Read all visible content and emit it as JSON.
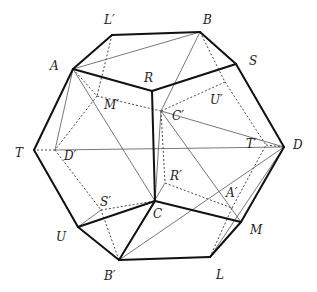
{
  "diagram": {
    "title": "",
    "vertices": {
      "A": [
        73,
        69
      ],
      "Lp": [
        112,
        35
      ],
      "B": [
        200,
        32
      ],
      "S": [
        236,
        64
      ],
      "R": [
        152,
        91
      ],
      "T": [
        34,
        150
      ],
      "D": [
        284,
        147
      ],
      "C": [
        155,
        201
      ],
      "U": [
        78,
        227
      ],
      "M": [
        241,
        222
      ],
      "Bp": [
        119,
        260
      ],
      "L": [
        210,
        257
      ],
      "Mp": [
        97,
        96
      ],
      "Cp": [
        161,
        111
      ],
      "Up": [
        225,
        82
      ],
      "Dp": [
        55,
        150
      ],
      "Tp": [
        266,
        145
      ],
      "Rp": [
        165,
        183
      ],
      "Ap": [
        232,
        208
      ],
      "Sp": [
        101,
        210
      ]
    },
    "labels": [
      {
        "id": "label-L-prime",
        "text": "L′",
        "x": 104,
        "y": 14
      },
      {
        "id": "label-B",
        "text": "B",
        "x": 203,
        "y": 14
      },
      {
        "id": "label-A",
        "text": "A",
        "x": 50,
        "y": 60
      },
      {
        "id": "label-S",
        "text": "S",
        "x": 249,
        "y": 55
      },
      {
        "id": "label-R",
        "text": "R",
        "x": 144,
        "y": 72
      },
      {
        "id": "label-M-prime",
        "text": "M′",
        "x": 104,
        "y": 99
      },
      {
        "id": "label-U-prime",
        "text": "U′",
        "x": 210,
        "y": 94
      },
      {
        "id": "label-C-prime",
        "text": "C′",
        "x": 172,
        "y": 110
      },
      {
        "id": "label-T",
        "text": "T",
        "x": 15,
        "y": 147
      },
      {
        "id": "label-D-prime",
        "text": "D′",
        "x": 64,
        "y": 150
      },
      {
        "id": "label-T-prime",
        "text": "T′",
        "x": 246,
        "y": 138
      },
      {
        "id": "label-D",
        "text": "D",
        "x": 293,
        "y": 139
      },
      {
        "id": "label-R-prime",
        "text": "R′",
        "x": 170,
        "y": 170
      },
      {
        "id": "label-A-prime",
        "text": "A′",
        "x": 226,
        "y": 187
      },
      {
        "id": "label-S-prime",
        "text": "S′",
        "x": 100,
        "y": 196
      },
      {
        "id": "label-C",
        "text": "C",
        "x": 153,
        "y": 208
      },
      {
        "id": "label-U",
        "text": "U",
        "x": 56,
        "y": 231
      },
      {
        "id": "label-M",
        "text": "M",
        "x": 250,
        "y": 224
      },
      {
        "id": "label-B-prime",
        "text": "B′",
        "x": 104,
        "y": 270
      },
      {
        "id": "label-L",
        "text": "L",
        "x": 216,
        "y": 269
      }
    ],
    "edges_thick": [
      [
        "A",
        "Lp"
      ],
      [
        "Lp",
        "B"
      ],
      [
        "B",
        "S"
      ],
      [
        "S",
        "D"
      ],
      [
        "D",
        "M"
      ],
      [
        "M",
        "L"
      ],
      [
        "L",
        "Bp"
      ],
      [
        "Bp",
        "U"
      ],
      [
        "U",
        "T"
      ],
      [
        "T",
        "A"
      ],
      [
        "A",
        "R"
      ],
      [
        "R",
        "S"
      ],
      [
        "R",
        "C"
      ],
      [
        "C",
        "U"
      ],
      [
        "C",
        "M"
      ],
      [
        "C",
        "Bp"
      ]
    ],
    "edges_thin": [
      [
        "A",
        "B"
      ],
      [
        "B",
        "Cp"
      ],
      [
        "A",
        "Dp"
      ],
      [
        "A",
        "C"
      ],
      [
        "Cp",
        "D"
      ],
      [
        "Dp",
        "D"
      ],
      [
        "Cp",
        "M"
      ],
      [
        "Sp",
        "U"
      ],
      [
        "Bp",
        "D"
      ],
      [
        "Bp",
        "Rp"
      ],
      [
        "L",
        "D"
      ],
      [
        "S",
        "D"
      ],
      [
        "C",
        "Cp"
      ]
    ],
    "edges_dashed": [
      [
        "Lp",
        "Mp"
      ],
      [
        "Mp",
        "Cp"
      ],
      [
        "Mp",
        "Dp"
      ],
      [
        "B",
        "Up"
      ],
      [
        "Up",
        "Cp"
      ],
      [
        "Up",
        "Tp"
      ],
      [
        "Tp",
        "D"
      ],
      [
        "Dp",
        "T"
      ],
      [
        "Dp",
        "Sp"
      ],
      [
        "Sp",
        "C"
      ],
      [
        "Cp",
        "Rp"
      ],
      [
        "Rp",
        "Ap"
      ],
      [
        "Ap",
        "Tp"
      ],
      [
        "Ap",
        "L"
      ],
      [
        "Bp",
        "Sp"
      ],
      [
        "A",
        "Mp"
      ]
    ],
    "colors": {
      "thick": "#111111",
      "thin": "#555555",
      "dashed": "#333333",
      "background": "#ffffff"
    }
  }
}
